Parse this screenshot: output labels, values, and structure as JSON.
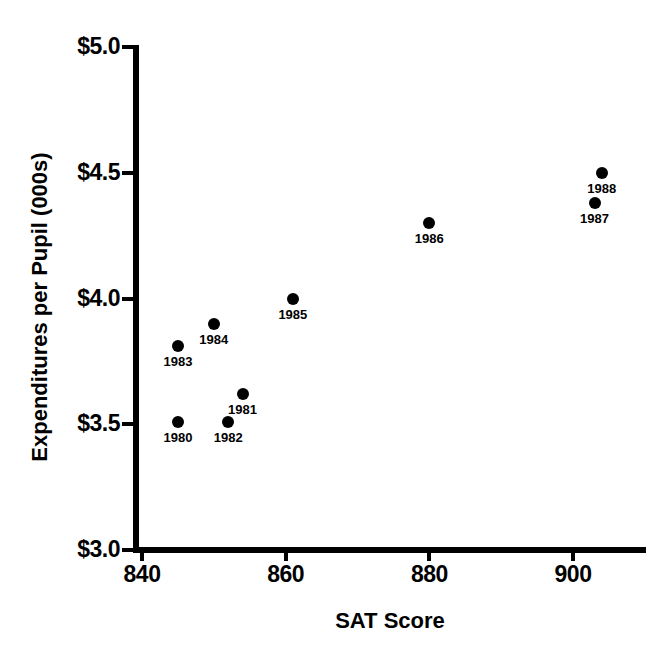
{
  "chart_data": {
    "type": "scatter",
    "title": "",
    "xlabel": "SAT Score",
    "ylabel": "Expenditures per Pupil (000s)",
    "xlim": [
      838,
      910
    ],
    "ylim": [
      3.0,
      5.0
    ],
    "grid": false,
    "legend": "none",
    "x_ticks": [
      {
        "value": 840,
        "label": "840"
      },
      {
        "value": 860,
        "label": "860"
      },
      {
        "value": 880,
        "label": "880"
      },
      {
        "value": 900,
        "label": "900"
      }
    ],
    "y_ticks": [
      {
        "value": 5.0,
        "label": "$5.0"
      },
      {
        "value": 4.5,
        "label": "$4.5"
      },
      {
        "value": 4.0,
        "label": "$4.0"
      },
      {
        "value": 3.5,
        "label": "$3.5"
      },
      {
        "value": 3.0,
        "label": "$3.0"
      }
    ],
    "points": [
      {
        "label": "1980",
        "x": 845,
        "y": 3.51
      },
      {
        "label": "1981",
        "x": 854,
        "y": 3.62
      },
      {
        "label": "1982",
        "x": 852,
        "y": 3.51
      },
      {
        "label": "1983",
        "x": 845,
        "y": 3.81
      },
      {
        "label": "1984",
        "x": 850,
        "y": 3.9
      },
      {
        "label": "1985",
        "x": 861,
        "y": 4.0
      },
      {
        "label": "1986",
        "x": 880,
        "y": 4.3
      },
      {
        "label": "1987",
        "x": 903,
        "y": 4.38
      },
      {
        "label": "1988",
        "x": 904,
        "y": 4.5
      }
    ],
    "marker_color": "#000000",
    "axis_color": "#000000"
  }
}
